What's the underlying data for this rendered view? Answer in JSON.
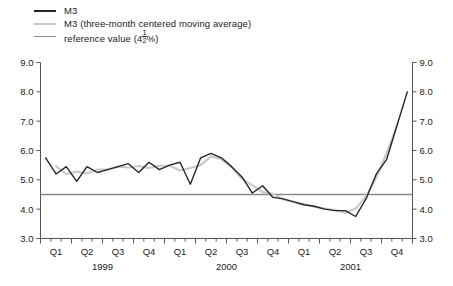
{
  "legend": {
    "items": [
      {
        "label": "M3",
        "color": "#262626",
        "name": "legend-m3"
      },
      {
        "label": "M3 (three-month centered moving average)",
        "color": "#c9c9c9",
        "name": "legend-m3-ma"
      },
      {
        "label": "reference value (4½%)",
        "color": "#8a8a8a",
        "name": "legend-reference-value"
      }
    ]
  },
  "chart_data": {
    "type": "line",
    "title": "",
    "xlabel": "",
    "ylabel": "",
    "ylim": [
      3.0,
      9.0
    ],
    "ytick_labels": [
      "3.0",
      "4.0",
      "5.0",
      "6.0",
      "7.0",
      "8.0",
      "9.0"
    ],
    "yticks": [
      3.0,
      4.0,
      5.0,
      6.0,
      7.0,
      8.0,
      9.0
    ],
    "grid": false,
    "legend_position": "top-left",
    "dual_axis": true,
    "x": [
      "1999-01",
      "1999-02",
      "1999-03",
      "1999-04",
      "1999-05",
      "1999-06",
      "1999-07",
      "1999-08",
      "1999-09",
      "1999-10",
      "1999-11",
      "1999-12",
      "2000-01",
      "2000-02",
      "2000-03",
      "2000-04",
      "2000-05",
      "2000-06",
      "2000-07",
      "2000-08",
      "2000-09",
      "2000-10",
      "2000-11",
      "2000-12",
      "2001-01",
      "2001-02",
      "2001-03",
      "2001-04",
      "2001-05",
      "2001-06",
      "2001-07",
      "2001-08",
      "2001-09",
      "2001-10",
      "2001-11",
      "2001-12"
    ],
    "quarter_labels": [
      "Q1",
      "Q2",
      "Q3",
      "Q4",
      "Q1",
      "Q2",
      "Q3",
      "Q4",
      "Q1",
      "Q2",
      "Q3",
      "Q4"
    ],
    "year_labels": [
      "1999",
      "2000",
      "2001"
    ],
    "reference_value": 4.5,
    "reference_label": "4½%",
    "series": [
      {
        "name": "M3",
        "color": "#262626",
        "values": [
          5.75,
          5.2,
          5.45,
          4.95,
          5.45,
          5.25,
          5.35,
          5.45,
          5.55,
          5.25,
          5.6,
          5.35,
          5.5,
          5.6,
          4.85,
          5.75,
          5.9,
          5.75,
          5.45,
          5.1,
          4.55,
          4.8,
          4.4,
          4.35,
          4.25,
          4.15,
          4.1,
          4.0,
          3.95,
          3.95,
          3.75,
          4.35,
          5.2,
          5.7,
          6.85,
          8.0
        ]
      },
      {
        "name": "M3 (three-month centered moving average)",
        "color": "#c9c9c9",
        "values": [
          null,
          5.47,
          5.2,
          5.28,
          5.22,
          5.35,
          5.35,
          5.45,
          5.42,
          5.47,
          5.4,
          5.48,
          5.48,
          5.32,
          5.4,
          5.5,
          5.8,
          5.7,
          5.43,
          5.03,
          4.82,
          4.58,
          4.52,
          4.33,
          4.25,
          4.17,
          4.08,
          4.02,
          3.97,
          3.88,
          4.02,
          4.43,
          5.08,
          5.92,
          6.85,
          null
        ]
      }
    ]
  }
}
